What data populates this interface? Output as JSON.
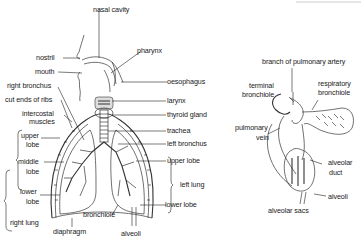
{
  "diagram": {
    "left_figure": {
      "name": "respiratory system",
      "labels": {
        "nasal_cavity": "nasal cavity",
        "pharynx": "pharynx",
        "nostril": "nostril",
        "mouth": "mouth",
        "oesophagus": "oesophagus",
        "right_bronchus": "right bronchus",
        "cut_ends_of_ribs": "cut ends of ribs",
        "larynx": "larynx",
        "intercostal": "intercostal",
        "muscles": "muscles",
        "thyroid_gland": "thyroid gland",
        "trachea": "trachea",
        "left_bronchus": "left bronchus",
        "upper_lobe_right_1": "upper",
        "upper_lobe_right_2": "lobe",
        "middle_lobe_1": "middle",
        "middle_lobe_2": "lobe",
        "lower_lobe_right_1": "lower",
        "lower_lobe_right_2": "lobe",
        "right_lung": "right lung",
        "upper_lobe_left": "upper lobe",
        "left_lung": "left lung",
        "lower_lobe_left": "lower lobe",
        "bronchiole": "bronchiole",
        "diaphragm": "diaphragm",
        "alveoli": "alveoli"
      }
    },
    "right_figure": {
      "name": "alveoli detail",
      "labels": {
        "branch_of_pulmonary_artery": "branch of pulmonary artery",
        "terminal_1": "terminal",
        "terminal_2": "bronchiole",
        "respiratory_1": "respiratory",
        "respiratory_2": "bronchiole",
        "pulmonary_vein_1": "pulmonary",
        "pulmonary_vein_2": "vein",
        "alveolar_duct_1": "alveolar",
        "alveolar_duct_2": "duct",
        "alveoli": "alveoli",
        "alveolar_sacs": "alveolar sacs"
      }
    }
  }
}
